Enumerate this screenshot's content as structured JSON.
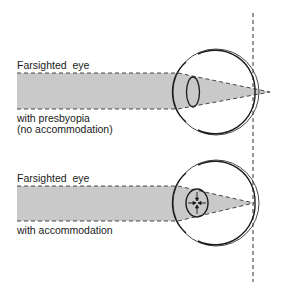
{
  "figure": {
    "top_panel": {
      "title": "Farsighted  eye",
      "caption_line1": "with presbyopia",
      "caption_line2": "(no accommodation)"
    },
    "bottom_panel": {
      "title": "Farsighted  eye",
      "caption_line1": "with accommodation"
    }
  },
  "colors": {
    "beam_fill": "#c9c9c9",
    "line": "#1a1a1a",
    "background": "#ffffff"
  }
}
